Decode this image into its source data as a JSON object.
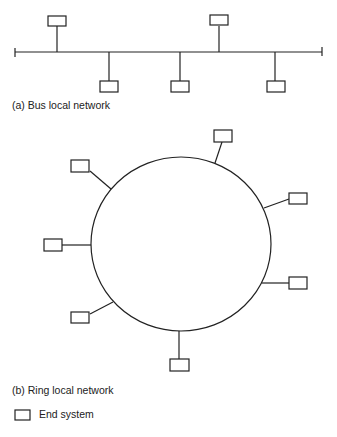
{
  "bus": {
    "caption": "(a) Bus local network",
    "node_count": 5
  },
  "ring": {
    "caption": "(b) Ring local network",
    "node_count": 8
  },
  "legend": {
    "label": "End system",
    "icon": "rectangle-icon"
  },
  "colors": {
    "line": "#222222",
    "background": "#ffffff"
  }
}
